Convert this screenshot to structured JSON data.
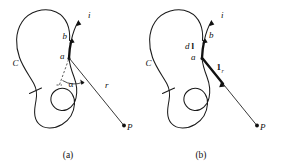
{
  "figure": {
    "background_color": "#ffffff",
    "ink_color": "#111111",
    "width": 283,
    "height": 167
  },
  "panels": [
    {
      "id": "a",
      "caption": "(a)",
      "labels": {
        "current": "i",
        "curve": "C",
        "point_a": "a",
        "point_b": "b",
        "angle": "α",
        "distance": "r",
        "field_point": "P"
      }
    },
    {
      "id": "b",
      "caption": "(b)",
      "labels": {
        "current": "i",
        "curve": "C",
        "point_a": "a",
        "point_b": "b",
        "element_d": "d",
        "element_vector": "l",
        "unit_vector": "1",
        "unit_vector_sub": "r",
        "field_point": "P"
      }
    }
  ]
}
